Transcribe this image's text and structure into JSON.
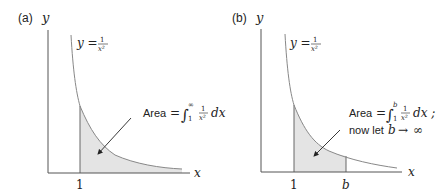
{
  "panels": [
    {
      "label": "(a)",
      "y_axis_label": "y",
      "x_axis_label": "x",
      "curve_label_lhs": "y =",
      "curve_frac_num": "1",
      "curve_frac_den": "x²",
      "tick_labels": [
        "1"
      ],
      "annotation": {
        "word": "Area",
        "eq": "=",
        "integral": "∫",
        "lower": "1",
        "upper": "∞",
        "frac_num": "1",
        "frac_den": "x²",
        "dx": "dx"
      }
    },
    {
      "label": "(b)",
      "y_axis_label": "y",
      "x_axis_label": "x",
      "curve_label_lhs": "y =",
      "curve_frac_num": "1",
      "curve_frac_den": "x²",
      "tick_labels": [
        "1",
        "b"
      ],
      "annotation": {
        "word": "Area",
        "eq": "=",
        "integral": "∫",
        "lower": "1",
        "upper": "b",
        "frac_num": "1",
        "frac_den": "x²",
        "dx": "dx ;",
        "line2_text": "now let",
        "line2_var": "b",
        "line2_arrow": "→",
        "line2_inf": "∞"
      }
    }
  ],
  "colors": {
    "axis": "#555555",
    "curve": "#888888",
    "shade": "#e4e4e4",
    "text": "#222222"
  }
}
